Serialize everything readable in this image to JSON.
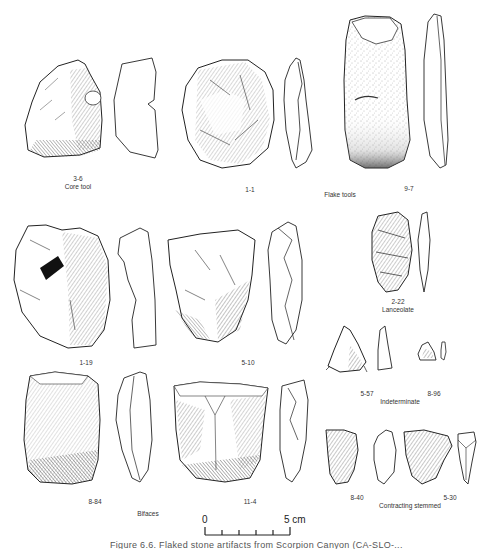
{
  "figure": {
    "caption_partial": "Figure 6.6. Flaked stone artifacts from Scorpion Canyon (CA-SLO-..."
  },
  "artifacts": [
    {
      "id": "3-6",
      "category_label": "Core tool"
    },
    {
      "id": "1-1",
      "category_label": ""
    },
    {
      "id": "9-7",
      "category_label": ""
    },
    {
      "id": "1-19",
      "category_label": ""
    },
    {
      "id": "5-10",
      "category_label": ""
    },
    {
      "id": "2-22",
      "category_label": "Lanceolate"
    },
    {
      "id": "5-57",
      "category_label": ""
    },
    {
      "id": "8-96",
      "category_label": ""
    },
    {
      "id": "8-84",
      "category_label": ""
    },
    {
      "id": "11-4",
      "category_label": ""
    },
    {
      "id": "8-40",
      "category_label": ""
    },
    {
      "id": "5-30",
      "category_label": ""
    }
  ],
  "group_labels": {
    "core_tool": "Core tool",
    "flake_tools": "Flake tools",
    "lanceolate": "Lanceolate",
    "indeterminate": "Indeterminate",
    "bifaces": "Bifaces",
    "contracting_stemmed": "Contracting stemmed"
  },
  "scale_bar": {
    "start_label": "0",
    "end_label": "5 cm",
    "divisions": 5
  }
}
